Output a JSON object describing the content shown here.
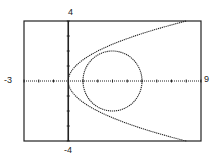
{
  "chart_data": {
    "type": "line",
    "title": "",
    "xlabel": "",
    "ylabel": "",
    "xlim": [
      -3,
      9
    ],
    "ylim": [
      -4,
      4
    ],
    "grid": false,
    "axis_ticks": {
      "x_step": 1,
      "y_step": 1
    },
    "window_labels": {
      "xmin": "-3",
      "xmax": "9",
      "ymin": "-4",
      "ymax": "4"
    },
    "series": [
      {
        "name": "parabola",
        "equation": "y^2 = 2x",
        "style": "dotted",
        "color": "#222222"
      },
      {
        "name": "circle",
        "equation": "(x-3)^2 + y^2 = 4",
        "center": [
          3,
          0
        ],
        "radius": 2,
        "style": "dotted",
        "color": "#222222"
      }
    ]
  },
  "colors": {
    "ink": "#222222",
    "background": "#ffffff"
  }
}
